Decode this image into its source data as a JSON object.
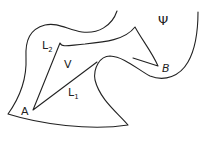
{
  "diagram": {
    "labels": {
      "A": "A",
      "B": "B",
      "V": "V",
      "L1": "L",
      "L1_sub": "1",
      "L2": "L",
      "L2_sub": "2",
      "Psi": "Ψ"
    },
    "stroke_color": "#222222"
  }
}
